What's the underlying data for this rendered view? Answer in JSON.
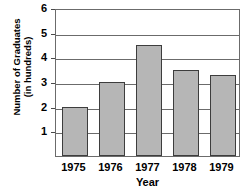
{
  "chart_data": {
    "type": "bar",
    "title": "",
    "xlabel": "Year",
    "ylabel": "Number of Graduates (in hundreds)",
    "ylabel_lines": [
      "Number of Graduates",
      "(in hundreds)"
    ],
    "categories": [
      "1975",
      "1976",
      "1977",
      "1978",
      "1979"
    ],
    "values": [
      2,
      3,
      4.5,
      3.5,
      3.3
    ],
    "ylim": [
      0,
      6
    ],
    "ytick_labels": [
      "1",
      "2",
      "3",
      "4",
      "5",
      "6"
    ],
    "ytick_values": [
      1,
      2,
      3,
      4,
      5,
      6
    ],
    "grid": true,
    "legend": "none",
    "bar_fill_color": "#b6b6b6",
    "bar_border_color": "#3d3d3d",
    "axis_color": "#6b6b6b"
  }
}
